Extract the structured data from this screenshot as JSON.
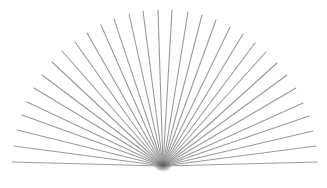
{
  "figure": {
    "type": "radial-line-fan",
    "width": 327,
    "height": 188,
    "background": "#ffffff",
    "line_color": "#9a9a9a",
    "center_blob_color": "#555555",
    "line_width": 1.1,
    "origin": [
      163,
      166
    ],
    "endpoints": [
      [
        12,
        162
      ],
      [
        14,
        146
      ],
      [
        17,
        130
      ],
      [
        22,
        115
      ],
      [
        27,
        102
      ],
      [
        34,
        88
      ],
      [
        42,
        75
      ],
      [
        52,
        62
      ],
      [
        62,
        51
      ],
      [
        75,
        42
      ],
      [
        87,
        33
      ],
      [
        101,
        25
      ],
      [
        114,
        19
      ],
      [
        129,
        14
      ],
      [
        143,
        11
      ],
      [
        158,
        10
      ],
      [
        172,
        10
      ],
      [
        188,
        12
      ],
      [
        202,
        15
      ],
      [
        216,
        20
      ],
      [
        230,
        27
      ],
      [
        243,
        34
      ],
      [
        255,
        43
      ],
      [
        266,
        52
      ],
      [
        277,
        63
      ],
      [
        287,
        75
      ],
      [
        296,
        88
      ],
      [
        303,
        103
      ],
      [
        309,
        116
      ],
      [
        313,
        131
      ],
      [
        316,
        146
      ],
      [
        317,
        162
      ]
    ],
    "line_count": 32
  }
}
